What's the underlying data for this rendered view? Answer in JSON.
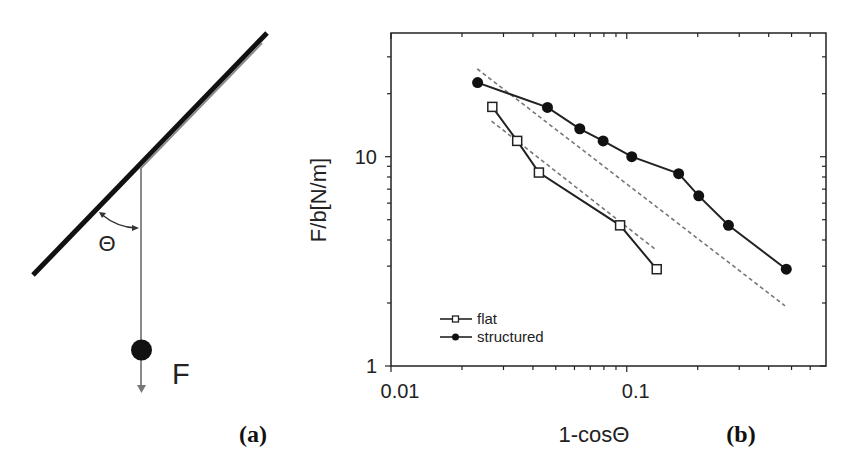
{
  "figure": {
    "panel_a": {
      "label": "(a)",
      "angle_symbol": "Θ",
      "force_symbol": "F",
      "colors": {
        "substrate": "#111111",
        "tape": "#888888",
        "ball": "#111111"
      }
    },
    "panel_b": {
      "label": "(b)"
    }
  },
  "chart_data": {
    "type": "line",
    "title": "",
    "xlabel": "1-cosΘ",
    "ylabel": "F/b[N/m]",
    "xscale": "log",
    "yscale": "log",
    "xlim": [
      0.01,
      0.7
    ],
    "ylim": [
      1,
      39
    ],
    "x_ticks": [
      {
        "value": 0.01,
        "label": "0.01"
      },
      {
        "value": 0.1,
        "label": "0.1"
      }
    ],
    "y_ticks": [
      {
        "value": 1,
        "label": "1"
      },
      {
        "value": 10,
        "label": "10"
      }
    ],
    "grid": false,
    "legend_position": "lower left",
    "series": [
      {
        "name": "flat",
        "marker": "open-square",
        "line": "solid",
        "color": "#222222",
        "x": [
          0.0269,
          0.0343,
          0.0424,
          0.0937,
          0.134
        ],
        "y": [
          17.3,
          11.9,
          8.4,
          4.7,
          2.9
        ]
      },
      {
        "name": "structured",
        "marker": "filled-circle",
        "line": "solid",
        "color": "#222222",
        "x": [
          0.0233,
          0.0461,
          0.0632,
          0.0794,
          0.105,
          0.166,
          0.202,
          0.27,
          0.475
        ],
        "y": [
          22.6,
          17.2,
          13.6,
          11.9,
          10.0,
          8.3,
          6.5,
          4.7,
          2.9
        ]
      }
    ],
    "fit_lines": [
      {
        "for": "flat",
        "style": "dashed",
        "color": "#777777",
        "x": [
          0.0267,
          0.133
        ],
        "y": [
          14.8,
          3.59
        ]
      },
      {
        "for": "structured",
        "style": "dashed",
        "color": "#777777",
        "x": [
          0.0232,
          0.469
        ],
        "y": [
          26.3,
          1.94
        ]
      }
    ]
  }
}
